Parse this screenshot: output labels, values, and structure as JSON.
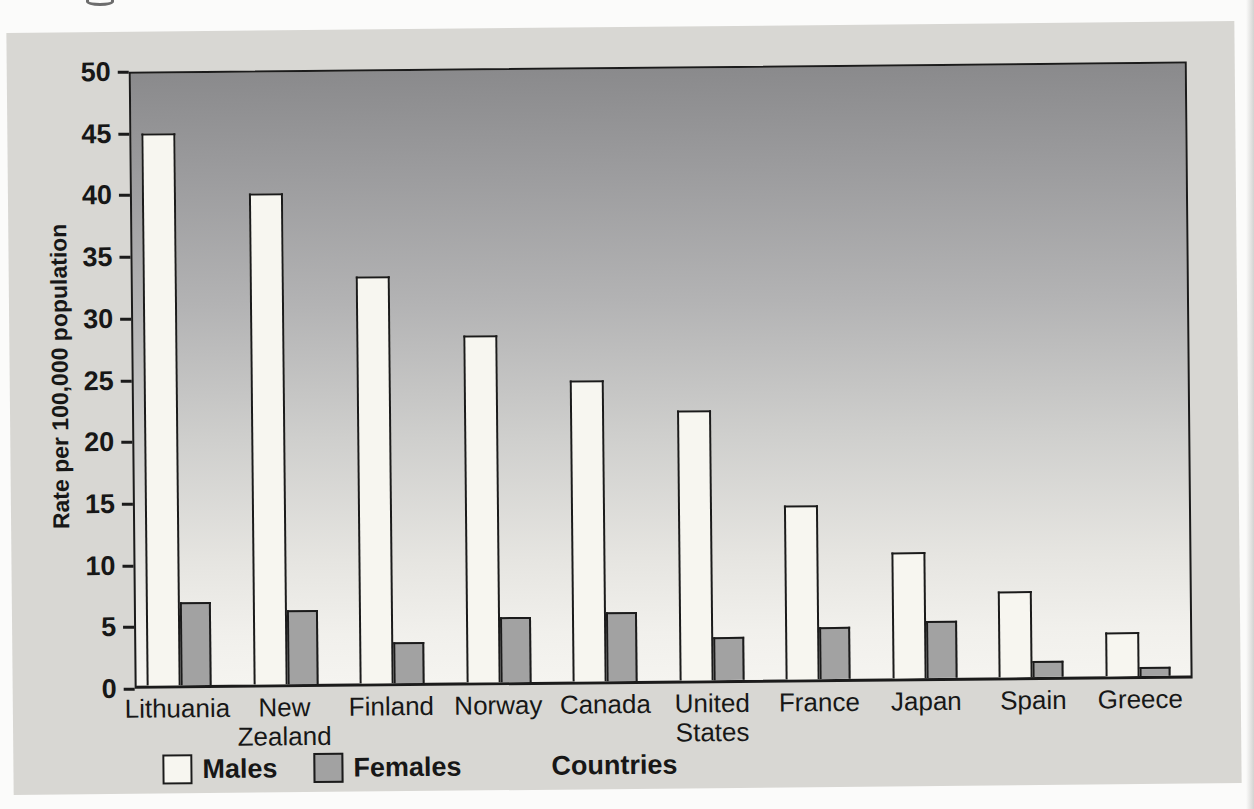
{
  "chart_data": {
    "type": "bar",
    "title": "",
    "categories": [
      "Lithuania",
      "New Zealand",
      "Finland",
      "Norway",
      "Canada",
      "United States",
      "France",
      "Japan",
      "Spain",
      "Greece"
    ],
    "series": [
      {
        "name": "Males",
        "color": "#f7f6f0",
        "values": [
          44.7,
          39.8,
          33.0,
          28.1,
          24.4,
          21.9,
          14.1,
          10.2,
          7.0,
          3.6
        ]
      },
      {
        "name": "Females",
        "color": "#a2a2a2",
        "values": [
          6.7,
          6.0,
          3.3,
          5.3,
          5.6,
          3.5,
          4.2,
          4.6,
          1.3,
          0.7
        ]
      }
    ],
    "xlabel": "Countries",
    "ylabel": "Rate per 100,000 population",
    "ylim": [
      0,
      50
    ],
    "yticks": [
      0,
      5,
      10,
      15,
      20,
      25,
      30,
      35,
      40,
      45,
      50
    ],
    "grid": false,
    "legend_position": "bottom-left",
    "plot_background_gradient": [
      "#8a8a8c",
      "#f5f4f0"
    ]
  },
  "colors": {
    "panel_background": "#d8d7d3",
    "page_background": "#fbfbfa",
    "axis_and_text": "#171717",
    "bar_border": "#1b1b1b"
  }
}
